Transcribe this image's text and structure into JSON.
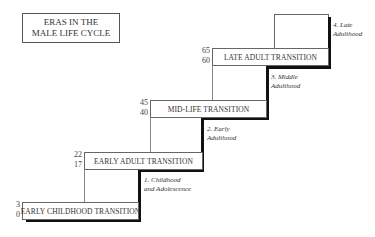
{
  "title": {
    "line1": "ERAS IN THE",
    "line2": "MALE LIFE CYCLE"
  },
  "transitions": [
    {
      "label": "EARLY CHILDHOOD TRANSITION",
      "age_start": "0",
      "age_end": "3"
    },
    {
      "label": "EARLY ADULT TRANSITION",
      "age_start": "17",
      "age_end": "22"
    },
    {
      "label": "MID-LIFE TRANSITION",
      "age_start": "40",
      "age_end": "45"
    },
    {
      "label": "LATE ADULT TRANSITION",
      "age_start": "60",
      "age_end": "65"
    }
  ],
  "eras": [
    {
      "line1": "1. Childhood",
      "line2": "and Adolescence"
    },
    {
      "line1": "2. Early",
      "line2": "Adulthood"
    },
    {
      "line1": "3. Middle",
      "line2": "Adulthood"
    },
    {
      "line1": "4. Late",
      "line2": "Adulthood"
    }
  ]
}
